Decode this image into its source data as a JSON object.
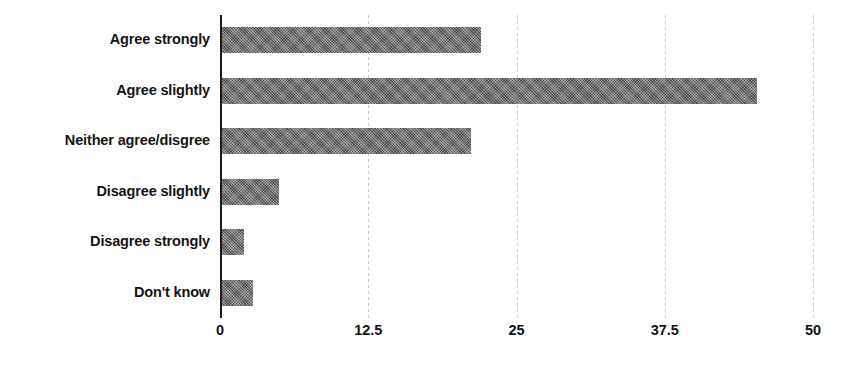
{
  "chart_data": {
    "type": "bar",
    "orientation": "horizontal",
    "title": "",
    "subtitle": "",
    "xlabel": "",
    "ylabel": "",
    "categories": [
      "Agree strongly",
      "Agree slightly",
      "Neither agree/disgree",
      "Disagree slightly",
      "Disagree strongly",
      "Don't know"
    ],
    "values": [
      22.0,
      45.3,
      21.2,
      5.0,
      2.0,
      2.8
    ],
    "xlim": [
      0,
      50
    ],
    "ylim": null,
    "xticks": [
      0,
      12.5,
      25,
      37.5,
      50
    ],
    "xtick_labels": [
      "0",
      "12.5",
      "25",
      "37.5",
      "50"
    ],
    "grid": "vertical-dashed",
    "legend": null,
    "legend_position": "none",
    "bar_fill_color": "#666666",
    "bar_fill_pattern": "cross-hatch",
    "axis_color": "#1a1a1a",
    "gridline_color": "#c9c9c9",
    "background_color": "#ffffff",
    "annotations": []
  }
}
